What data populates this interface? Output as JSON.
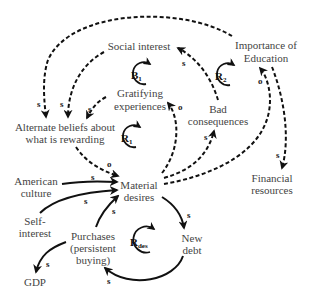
{
  "nodes": {
    "social_interest": "Social interest",
    "importance_line1": "Importance of",
    "importance_line2": "Education",
    "gratifying_line1": "Gratifying",
    "gratifying_line2": "experiences",
    "bad_line1": "Bad",
    "bad_line2": "consequences",
    "alt_line1": "Alternate beliefs about",
    "alt_line2": "what is rewarding",
    "american_line1": "American",
    "american_line2": "culture",
    "material_line1": "Material",
    "material_line2": "desires",
    "financial_line1": "Financial",
    "financial_line2": "resources",
    "self_line1": "Self-",
    "self_line2": "interest",
    "purchases_line1": "Purchases",
    "purchases_line2": "(persistent",
    "purchases_line3": "buying)",
    "new_debt_line1": "New",
    "new_debt_line2": "debt",
    "gdp": "GDP"
  },
  "loops": {
    "b1": {
      "letter": "B",
      "sub": "1"
    },
    "r2": {
      "letter": "R",
      "sub": "2"
    },
    "r1": {
      "letter": "R",
      "sub": "1"
    },
    "rdes": {
      "letter": "R",
      "sub": "des"
    }
  },
  "polarities": {
    "s": "s",
    "o": "o"
  },
  "links": [
    {
      "from": "Material desires",
      "to": "Alternate beliefs about what is rewarding",
      "polarity": "o",
      "style": "dashed"
    },
    {
      "from": "Social interest",
      "to": "Alternate beliefs about what is rewarding",
      "polarity": "s",
      "style": "dashed"
    },
    {
      "from": "Gratifying experiences",
      "to": "Alternate beliefs about what is rewarding",
      "polarity": "s",
      "style": "dashed"
    },
    {
      "from": "Importance of Education",
      "to": "Alternate beliefs about what is rewarding",
      "polarity": "s",
      "style": "dashed"
    },
    {
      "from": "Material desires",
      "to": "Gratifying experiences",
      "polarity": "o",
      "style": "dashed"
    },
    {
      "from": "Material desires",
      "to": "Bad consequences",
      "polarity": "s",
      "style": "dashed"
    },
    {
      "from": "Bad consequences",
      "to": "Social interest",
      "polarity": "s",
      "style": "dashed"
    },
    {
      "from": "Material desires",
      "to": "Importance of Education",
      "polarity": "o",
      "style": "dashed"
    },
    {
      "from": "Importance of Education",
      "to": "Financial resources",
      "polarity": "s",
      "style": "dashed"
    },
    {
      "from": "American culture",
      "to": "Material desires",
      "polarity": "s",
      "style": "solid"
    },
    {
      "from": "Self-interest",
      "to": "Material desires",
      "polarity": "s",
      "style": "solid"
    },
    {
      "from": "Purchases (persistent buying)",
      "to": "Material desires",
      "polarity": "s",
      "style": "solid"
    },
    {
      "from": "Material desires",
      "to": "New debt",
      "polarity": "s",
      "style": "solid"
    },
    {
      "from": "New debt",
      "to": "Purchases (persistent buying)",
      "polarity": "s",
      "style": "solid"
    },
    {
      "from": "Purchases (persistent buying)",
      "to": "GDP",
      "polarity": "s",
      "style": "solid"
    }
  ]
}
